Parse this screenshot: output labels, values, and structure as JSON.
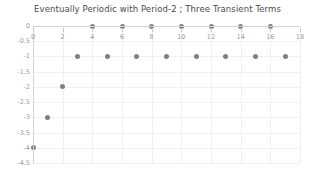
{
  "chart_data": {
    "type": "scatter",
    "title": "Eventually Periodic with Period-2 ; Three Transient Terms",
    "xlabel": "",
    "ylabel": "",
    "xlim": [
      0,
      18
    ],
    "ylim": [
      -4.5,
      0
    ],
    "grid": true,
    "legend": null,
    "marker_color": "#808080",
    "x": [
      0,
      1,
      2,
      3,
      4,
      5,
      6,
      7,
      8,
      9,
      10,
      11,
      12,
      13,
      14,
      15,
      16,
      17
    ],
    "values": [
      -4,
      -3,
      -2,
      -1,
      0,
      -1,
      0,
      -1,
      0,
      -1,
      0,
      -1,
      0,
      -1,
      0,
      -1,
      0,
      -1
    ],
    "xticks": [
      0,
      2,
      4,
      6,
      8,
      10,
      12,
      14,
      16,
      18
    ],
    "xtick_labels": [
      "0",
      "2",
      "4",
      "6",
      "8",
      "10",
      "12",
      "14",
      "16",
      "18"
    ],
    "yticks": [
      0,
      -0.5,
      -1,
      -1.5,
      -2,
      -2.5,
      -3,
      -3.5,
      -4,
      -4.5
    ],
    "ytick_labels": [
      "0",
      "-0.5",
      "-1",
      "-1.5",
      "-2",
      "-2.5",
      "-3",
      "-3.5",
      "-4",
      "-4.5"
    ]
  }
}
